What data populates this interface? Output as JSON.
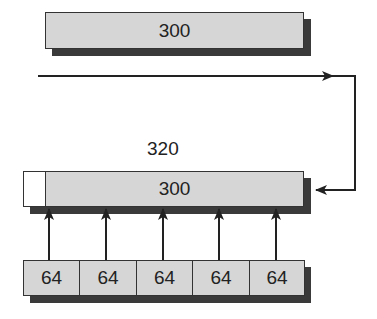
{
  "diagram": {
    "top_block": {
      "label": "300"
    },
    "extended_block": {
      "width_label": "320",
      "inner_label": "300"
    },
    "segments": [
      {
        "label": "64"
      },
      {
        "label": "64"
      },
      {
        "label": "64"
      },
      {
        "label": "64"
      },
      {
        "label": "64"
      }
    ],
    "colors": {
      "fill": "#d6d6d6",
      "shadow": "#3a3a3a",
      "stroke": "#222222",
      "pad": "#ffffff"
    }
  }
}
